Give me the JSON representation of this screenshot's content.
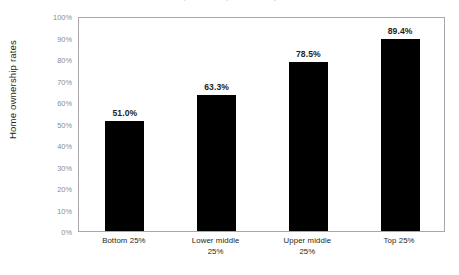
{
  "figure": {
    "clipped_top_text": "Home ownership rates by income quartile",
    "background_color": "#ffffff",
    "plot_border_color": "#a8a8ac",
    "bar_color": "#000000",
    "tick_label_color": "#8c8c8c",
    "text_color": "#231f20"
  },
  "chart_data": {
    "type": "bar",
    "title": "",
    "xlabel": "",
    "ylabel": "Home ownership rates",
    "categories": [
      "Bottom 25%",
      "Lower middle 25%",
      "Upper middle 25%",
      "Top 25%"
    ],
    "category_lines": [
      [
        "Bottom 25%"
      ],
      [
        "Lower middle",
        "25%"
      ],
      [
        "Upper middle",
        "25%"
      ],
      [
        "Top 25%"
      ]
    ],
    "values": [
      51.0,
      63.3,
      78.5,
      89.4
    ],
    "value_labels": [
      "51.0%",
      "63.3%",
      "78.5%",
      "89.4%"
    ],
    "ylim": [
      0,
      100
    ],
    "ytick_values": [
      0,
      10,
      20,
      30,
      40,
      50,
      60,
      70,
      80,
      90,
      100
    ],
    "ytick_labels": [
      "0%",
      "10%",
      "20%",
      "30%",
      "40%",
      "50%",
      "60%",
      "70%",
      "80%",
      "90%",
      "100%"
    ],
    "grid": false,
    "legend": false,
    "legend_position": "none",
    "series": [
      {
        "name": "Home ownership rates",
        "values": [
          51.0,
          63.3,
          78.5,
          89.4
        ]
      }
    ]
  }
}
